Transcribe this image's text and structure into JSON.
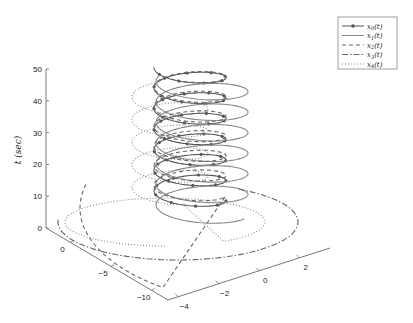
{
  "chart_data": {
    "type": "line",
    "projection": "3d",
    "title": "",
    "xlabel": "",
    "ylabel": "",
    "zlabel": "t (sec)",
    "axes": {
      "x_ticks": [
        0,
        -5,
        -10
      ],
      "y_ticks": [
        -4,
        -2,
        0,
        2
      ],
      "z_ticks": [
        0,
        10,
        20,
        30,
        40,
        50
      ],
      "xlim": [
        -12,
        3
      ],
      "ylim": [
        -4.5,
        3.5
      ],
      "zlim": [
        0,
        50
      ],
      "grid": false
    },
    "legend": {
      "position": "upper-right-outside",
      "entries": [
        "x_0(t)",
        "x_1(t)",
        "x_2(t)",
        "x_3(t)",
        "x_4(t)"
      ]
    },
    "series": [
      {
        "name": "x_0(t)",
        "style": "solid-marker",
        "color": "#555555",
        "radius": 1.0,
        "center": [
          0,
          0
        ],
        "turns": 6.5,
        "t_range": [
          5,
          47
        ],
        "phase": 0.0
      },
      {
        "name": "x_1(t)",
        "style": "solid",
        "color": "#888888",
        "radius": 1.35,
        "center": [
          0.4,
          0.3
        ],
        "turns": 6.5,
        "t_range": [
          3,
          45
        ],
        "phase": 0.4
      },
      {
        "name": "x_2(t)",
        "style": "dashed",
        "color": "#666666",
        "radius": 1.0,
        "center": [
          0,
          0
        ],
        "turns": 6.5,
        "t_range": [
          8,
          47
        ],
        "phase": 0.2,
        "tail": "wide-loop"
      },
      {
        "name": "x_3(t)",
        "style": "dash-dot",
        "color": "#666666",
        "radius": 1.0,
        "center": [
          0,
          0
        ],
        "turns": 0,
        "t_range": [
          0,
          10
        ],
        "tail": "big-ellipse"
      },
      {
        "name": "x_4(t)",
        "style": "dotted",
        "color": "#888888",
        "radius": 1.6,
        "center": [
          -1.5,
          0.6
        ],
        "turns": 5,
        "t_range": [
          0,
          38
        ],
        "phase": 1.2,
        "tail": "big-ellipse-dotted"
      }
    ]
  },
  "labels": {
    "z_axis": "t  (sec)",
    "legend": [
      "x0(t)",
      "x1(t)",
      "x2(t)",
      "x3(t)",
      "x4(t)"
    ]
  }
}
